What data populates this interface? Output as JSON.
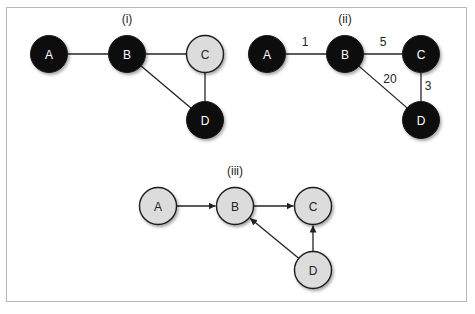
{
  "colors": {
    "dark_node": "#0d0d0d",
    "light_node": "#dcdcdc",
    "node_stroke": "#1a1a1a",
    "edge": "#222222",
    "border": "#b8b8b8",
    "dark_text": "#ffffff",
    "light_text": "#222222"
  },
  "diagrams": [
    {
      "title": "(i)",
      "title_pos": [
        127,
        23
      ],
      "directed": false,
      "nodes": [
        {
          "id": "A",
          "label": "A",
          "x": 49,
          "y": 54,
          "fill": "dark"
        },
        {
          "id": "B",
          "label": "B",
          "x": 127,
          "y": 54,
          "fill": "dark"
        },
        {
          "id": "C",
          "label": "C",
          "x": 205,
          "y": 54,
          "fill": "light"
        },
        {
          "id": "D",
          "label": "D",
          "x": 205,
          "y": 120,
          "fill": "dark"
        }
      ],
      "edges": [
        {
          "from": "A",
          "to": "B"
        },
        {
          "from": "B",
          "to": "C"
        },
        {
          "from": "B",
          "to": "D"
        },
        {
          "from": "C",
          "to": "D"
        }
      ]
    },
    {
      "title": "(ii)",
      "title_pos": [
        345,
        23
      ],
      "directed": false,
      "nodes": [
        {
          "id": "A",
          "label": "A",
          "x": 267,
          "y": 54,
          "fill": "dark"
        },
        {
          "id": "B",
          "label": "B",
          "x": 345,
          "y": 54,
          "fill": "dark"
        },
        {
          "id": "C",
          "label": "C",
          "x": 421,
          "y": 54,
          "fill": "dark"
        },
        {
          "id": "D",
          "label": "D",
          "x": 421,
          "y": 120,
          "fill": "dark"
        }
      ],
      "edges": [
        {
          "from": "A",
          "to": "B",
          "weight": "1",
          "label_pos": [
            305,
            46
          ]
        },
        {
          "from": "B",
          "to": "C",
          "weight": "5",
          "label_pos": [
            383,
            46
          ]
        },
        {
          "from": "B",
          "to": "D",
          "weight": "20",
          "label_pos": [
            390,
            83
          ]
        },
        {
          "from": "C",
          "to": "D",
          "weight": "3",
          "label_pos": [
            428,
            90
          ]
        }
      ]
    },
    {
      "title": "(iii)",
      "title_pos": [
        235,
        175
      ],
      "directed": true,
      "nodes": [
        {
          "id": "A",
          "label": "A",
          "x": 158,
          "y": 206,
          "fill": "light"
        },
        {
          "id": "B",
          "label": "B",
          "x": 235,
          "y": 206,
          "fill": "light"
        },
        {
          "id": "C",
          "label": "C",
          "x": 313,
          "y": 206,
          "fill": "light"
        },
        {
          "id": "D",
          "label": "D",
          "x": 313,
          "y": 270,
          "fill": "light"
        }
      ],
      "edges": [
        {
          "from": "A",
          "to": "B"
        },
        {
          "from": "B",
          "to": "C"
        },
        {
          "from": "D",
          "to": "B"
        },
        {
          "from": "D",
          "to": "C"
        }
      ]
    }
  ]
}
